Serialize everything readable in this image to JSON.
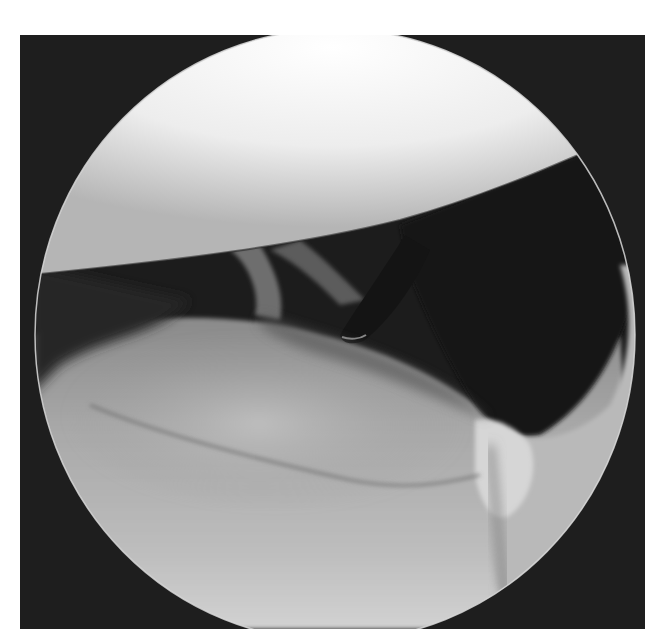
{
  "image": {
    "description": "Grayscale arthroscopic view inside a circular field of view on a dark square background",
    "colors": {
      "page_background": "#ffffff",
      "frame_background": "#1e1e1e",
      "bright_surface": "#f4f4f4",
      "dark_cavity": "#1a1a1a",
      "tissue_mid": "#9a9a9a",
      "tissue_light": "#c8c8c8",
      "rim_highlight": "#d8d8d8"
    },
    "regions": [
      {
        "name": "upper-condyle-surface",
        "tone": "bright"
      },
      {
        "name": "joint-space",
        "tone": "dark"
      },
      {
        "name": "lower-tissue-surface",
        "tone": "mid-gray"
      },
      {
        "name": "probe-instrument",
        "tone": "dark"
      }
    ]
  }
}
